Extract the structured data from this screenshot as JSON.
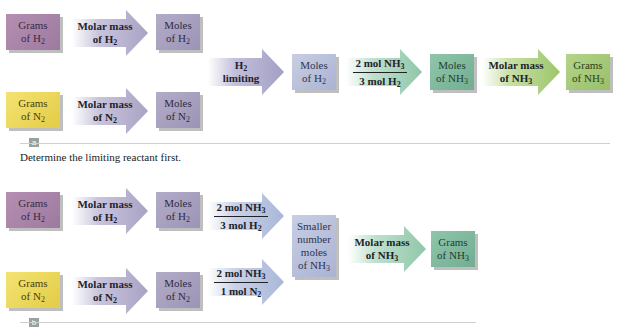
{
  "panel_a": {
    "label": "a",
    "caption": "Determine the limiting reactant first.",
    "h2_row": {
      "grams": {
        "line1": "Grams",
        "line2": "of H",
        "sub": "2"
      },
      "arrow": {
        "line1": "Molar mass",
        "line2": "of H",
        "sub": "2"
      },
      "moles": {
        "line1": "Moles",
        "line2": "of H",
        "sub": "2"
      }
    },
    "n2_row": {
      "grams": {
        "line1": "Grams",
        "line2": "of N",
        "sub": "2"
      },
      "arrow": {
        "line1": "Molar mass",
        "line2": "of N",
        "sub": "2"
      },
      "moles": {
        "line1": "Moles",
        "line2": "of N",
        "sub": "2"
      }
    },
    "chain": {
      "limiting_arrow": {
        "line1": "H",
        "line1_sub": "2",
        "line2": "limiting"
      },
      "moles_h2": {
        "line1": "Moles",
        "line2": "of H",
        "sub": "2"
      },
      "ratio_arrow": {
        "num": "2 mol NH",
        "num_sub": "3",
        "den": "3 mol H",
        "den_sub": "2"
      },
      "moles_nh3": {
        "line1": "Moles",
        "line2": "of NH",
        "sub": "3"
      },
      "molar_arrow": {
        "line1": "Molar mass",
        "line2": "of NH",
        "sub": "3"
      },
      "grams_nh3": {
        "line1": "Grams",
        "line2": "of NH",
        "sub": "3"
      }
    }
  },
  "panel_b": {
    "label": "b",
    "h2_row": {
      "grams": {
        "line1": "Grams",
        "line2": "of H",
        "sub": "2"
      },
      "arrow": {
        "line1": "Molar mass",
        "line2": "of H",
        "sub": "2"
      },
      "moles": {
        "line1": "Moles",
        "line2": "of H",
        "sub": "2"
      },
      "ratio_arrow": {
        "num": "2 mol NH",
        "num_sub": "3",
        "den": "3 mol H",
        "den_sub": "2"
      }
    },
    "n2_row": {
      "grams": {
        "line1": "Grams",
        "line2": "of N",
        "sub": "2"
      },
      "arrow": {
        "line1": "Molar mass",
        "line2": "of N",
        "sub": "2"
      },
      "moles": {
        "line1": "Moles",
        "line2": "of N",
        "sub": "2"
      },
      "ratio_arrow": {
        "num": "2 mol NH",
        "num_sub": "3",
        "den": "1 mol N",
        "den_sub": "2"
      }
    },
    "smaller": {
      "line1": "Smaller",
      "line2": "number",
      "line3": "moles",
      "line4": "of NH",
      "sub": "3"
    },
    "molar_arrow": {
      "line1": "Molar mass",
      "line2": "of NH",
      "sub": "3"
    },
    "grams_nh3": {
      "line1": "Grams",
      "line2": "of NH",
      "sub": "3"
    }
  },
  "colors": {
    "arrow_lavender": "#b4b0cc",
    "arrow_blue": "#a9b7d8",
    "arrow_teal": "#8fc7a9",
    "arrow_green": "#9cc66a"
  }
}
